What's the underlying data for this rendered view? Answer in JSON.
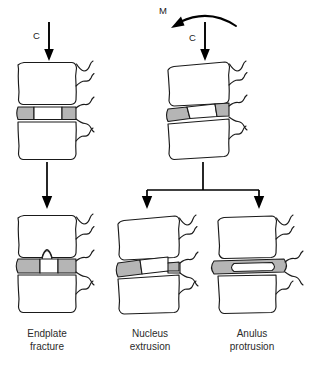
{
  "figure": {
    "background_color": "#ffffff",
    "line_color": "#1a1a1a",
    "anulus_fill": "#b5b5b5",
    "nucleus_fill": "#ffffff"
  },
  "loads": {
    "compression_left": {
      "symbol": "C",
      "name": "compression-force"
    },
    "compression_right": {
      "symbol": "C",
      "name": "compression-force"
    },
    "moment_right": {
      "symbol": "M",
      "name": "bending-moment"
    }
  },
  "panels": {
    "top_left": {
      "id": "compression-only-segment",
      "description": "Motion segment under pure compression, disc of uniform height",
      "load_symbols": [
        "C"
      ]
    },
    "top_right": {
      "id": "compression-plus-moment-segment",
      "description": "Motion segment under compression plus flexion moment, disc wedged",
      "load_symbols": [
        "M",
        "C"
      ]
    },
    "bottom_left": {
      "id": "endplate-fracture-segment",
      "caption_line1": "Endplate",
      "caption_line2": "fracture"
    },
    "bottom_middle": {
      "id": "nucleus-extrusion-segment",
      "caption_line1": "Nucleus",
      "caption_line2": "extrusion"
    },
    "bottom_right": {
      "id": "anulus-protrusion-segment",
      "caption_line1": "Anulus",
      "caption_line2": "protrusion"
    }
  },
  "captions": [
    {
      "line1": "Endplate",
      "line2": "fracture"
    },
    {
      "line1": "Nucleus",
      "line2": "extrusion"
    },
    {
      "line1": "Anulus",
      "line2": "protrusion"
    }
  ],
  "flow": {
    "left_branch": "single arrow from compression segment to endplate fracture",
    "right_branch": "branching arrow from compression-plus-moment segment to nucleus extrusion and anulus protrusion"
  }
}
